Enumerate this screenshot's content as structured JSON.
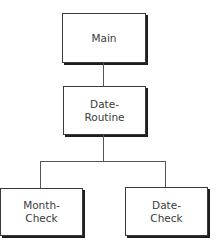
{
  "diagram": {
    "type": "hierarchy-chart",
    "nodes": [
      {
        "id": "main",
        "lines": [
          "Main"
        ]
      },
      {
        "id": "date-routine",
        "lines": [
          "Date-",
          "Routine"
        ]
      },
      {
        "id": "month-check",
        "lines": [
          "Month-",
          "Check"
        ]
      },
      {
        "id": "date-check",
        "lines": [
          "Date-",
          "Check"
        ]
      }
    ],
    "edges": [
      {
        "from": "main",
        "to": "date-routine"
      },
      {
        "from": "date-routine",
        "to": "month-check"
      },
      {
        "from": "date-routine",
        "to": "date-check"
      }
    ],
    "colors": {
      "border": "#3a3a3a",
      "shadow": "#1e1e1e",
      "connector": "#555555",
      "text": "#3a3a3a",
      "background": "#ffffff"
    }
  }
}
